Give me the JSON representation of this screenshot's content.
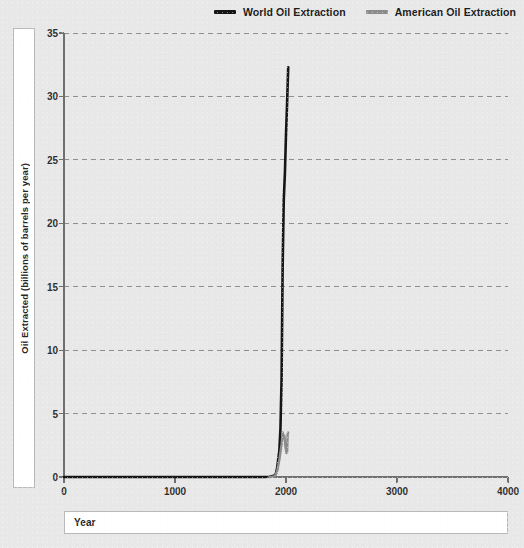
{
  "legend": {
    "position": "top-right",
    "entries": [
      {
        "label": "World Oil Extraction",
        "color": "#151515",
        "icon": "line-swatch-icon"
      },
      {
        "label": "American Oil Extraction",
        "color": "#8c8c8c",
        "icon": "line-swatch-icon"
      }
    ]
  },
  "axes": {
    "x_title": "Year",
    "y_title": "Oil Extracted (billions of barrels per year)"
  },
  "chart_data": {
    "type": "line",
    "title": "",
    "subtitle": "",
    "xlabel": "Year",
    "ylabel": "Oil Extracted (billions of barrels per year)",
    "xlim": [
      0,
      4000
    ],
    "ylim": [
      0,
      35
    ],
    "xticks": [
      0,
      1000,
      2000,
      3000,
      4000
    ],
    "yticks": [
      0,
      5,
      10,
      15,
      20,
      25,
      30,
      35
    ],
    "xticklabels": [
      "0",
      "1000",
      "2000",
      "3000",
      "4000"
    ],
    "yticklabels": [
      "0",
      "5",
      "10",
      "15",
      "20",
      "25",
      "30",
      "35"
    ],
    "grid": "horizontal-dashed",
    "background": "#e8e8e8",
    "series": [
      {
        "name": "World Oil Extraction",
        "color": "#151515",
        "width": 2.6,
        "points": [
          [
            0,
            0.0
          ],
          [
            500,
            0.0
          ],
          [
            1000,
            0.0
          ],
          [
            1400,
            0.0
          ],
          [
            1700,
            0.0
          ],
          [
            1800,
            0.0
          ],
          [
            1850,
            0.02
          ],
          [
            1870,
            0.05
          ],
          [
            1890,
            0.1
          ],
          [
            1900,
            0.15
          ],
          [
            1910,
            0.3
          ],
          [
            1920,
            0.7
          ],
          [
            1930,
            1.4
          ],
          [
            1940,
            2.1
          ],
          [
            1950,
            3.8
          ],
          [
            1960,
            7.7
          ],
          [
            1970,
            16.7
          ],
          [
            1980,
            21.9
          ],
          [
            1990,
            23.9
          ],
          [
            2000,
            27.0
          ],
          [
            2010,
            29.5
          ],
          [
            2020,
            32.3
          ]
        ]
      },
      {
        "name": "American Oil Extraction",
        "color": "#8c8c8c",
        "width": 2.4,
        "points": [
          [
            1850,
            0.0
          ],
          [
            1880,
            0.03
          ],
          [
            1900,
            0.07
          ],
          [
            1920,
            0.45
          ],
          [
            1940,
            1.35
          ],
          [
            1950,
            1.97
          ],
          [
            1960,
            2.57
          ],
          [
            1970,
            3.52
          ],
          [
            1975,
            3.06
          ],
          [
            1985,
            3.27
          ],
          [
            1995,
            2.39
          ],
          [
            2005,
            1.89
          ],
          [
            2010,
            2.0
          ],
          [
            2015,
            3.4
          ],
          [
            2020,
            3.5
          ]
        ]
      }
    ]
  }
}
